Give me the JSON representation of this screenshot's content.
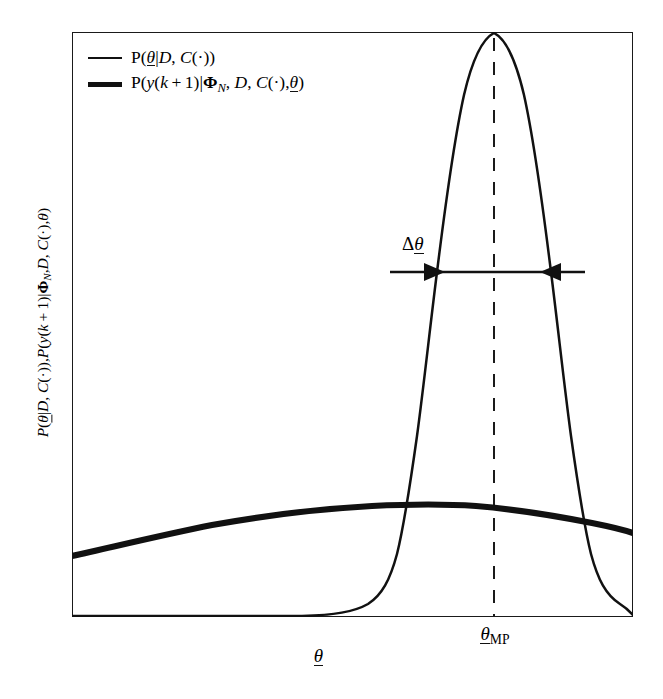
{
  "figure": {
    "background_color": "#ffffff",
    "frame_color": "#1a1a1a",
    "curve_color": "#111111"
  },
  "legend": {
    "position": "top-left",
    "entries": [
      {
        "swatch": "thin-line",
        "label_html": "P(<span class=\"mi uline\">θ</span>|<span class=\"mcal\">D</span>, <span class=\"mi\">C</span>(·))",
        "label_text": "P(θ|D, C(·))",
        "series": "parameter-posterior"
      },
      {
        "swatch": "thick-line",
        "label_html": "P(<span class=\"mi\">y</span>(<span class=\"mi\">k</span>&#8239;+&#8239;1)|<span class=\"mbf\">Φ</span><span class=\"sub it\">N</span>, <span class=\"mcal\">D</span>, <span class=\"mi\">C</span>(·),<span class=\"mi uline\">θ</span>)",
        "label_text": "P(y(k+1)|Φ_N, D, C(·),θ)",
        "series": "predictive-distribution"
      }
    ]
  },
  "axes": {
    "ylabel_html": "<span class=\"mi\">P</span>(<span class=\"mi uline\">θ</span>|<span class=\"mcal\">D</span>, <span class=\"mi\">C</span>(·)),<span class=\"mi\">P</span>(<span class=\"mi\">y</span>(<span class=\"mi\">k</span>&#8239;+&#8239;1)|<span class=\"mbf\">Φ</span><span class=\"sub it\">N</span>,<span class=\"mcal\">D</span>, <span class=\"mi\">C</span>(·),<span class=\"mi\">θ</span>)",
    "ylabel_text": "P(θ|D, C(·)),P(y(k+1)|Φ_N,D, C(·),θ)",
    "xlabel_html": "<span class=\"mi uline\">θ</span>",
    "xlabel_text": "θ",
    "xticks": [
      {
        "label_html": "<span class=\"mi uline\">θ</span><span class=\"sub\">MP</span>",
        "label_text": "θ_MP",
        "position_fraction": 0.752
      }
    ],
    "yticks": [],
    "grid": false,
    "xlim": [
      0,
      1
    ],
    "ylim": [
      0,
      1
    ]
  },
  "annotations": {
    "delta_width": {
      "label_html": "Δ<span class=\"mi uline\">θ</span>",
      "label_text": "Δθ",
      "style": "double-headed-arrow-inward",
      "y_fraction": 0.411
    },
    "map_line": {
      "style": "dashed-vertical",
      "x_fraction": 0.752
    }
  },
  "chart_data": {
    "type": "line",
    "title": "",
    "xlabel": "θ",
    "ylabel": "P(θ|D, C(·)),P(y(k+1)|Φ_N,D, C(·),θ)",
    "xlim": [
      0,
      1
    ],
    "ylim": [
      0,
      1
    ],
    "grid": false,
    "legend_position": "top-left",
    "annotations": [
      {
        "type": "vline",
        "x": 0.752,
        "style": "dashed",
        "label": "θ_MP"
      },
      {
        "type": "arrow-span",
        "x0": 0.665,
        "x1": 0.834,
        "y": 0.589,
        "label": "Δθ"
      }
    ],
    "series": [
      {
        "name": "P(θ|D, C(·))",
        "style": "thin",
        "description": "Sharply peaked posterior over the parameter vector, peaking at θ_MP",
        "peak_x": 0.752,
        "peak_y": 1.0,
        "x": [
          0.0,
          0.1,
          0.2,
          0.3,
          0.4,
          0.45,
          0.5,
          0.515,
          0.53,
          0.545,
          0.56,
          0.575,
          0.59,
          0.605,
          0.62,
          0.635,
          0.65,
          0.665,
          0.68,
          0.695,
          0.71,
          0.725,
          0.74,
          0.752,
          0.765,
          0.78,
          0.795,
          0.81,
          0.825,
          0.84,
          0.855,
          0.87,
          0.885,
          0.9,
          0.915,
          0.93,
          0.95,
          0.975,
          1.0
        ],
        "y": [
          0.0,
          0.0,
          0.0,
          0.0,
          0.001,
          0.002,
          0.005,
          0.008,
          0.013,
          0.021,
          0.034,
          0.055,
          0.087,
          0.135,
          0.203,
          0.293,
          0.401,
          0.52,
          0.64,
          0.75,
          0.845,
          0.925,
          0.982,
          1.0,
          0.985,
          0.93,
          0.845,
          0.74,
          0.62,
          0.495,
          0.375,
          0.27,
          0.184,
          0.12,
          0.075,
          0.045,
          0.018,
          0.005,
          0.001
        ]
      },
      {
        "name": "P(y(k+1)|Φ_N, D, C(·),θ)",
        "style": "thick",
        "description": "Broad, nearly flat predictive distribution with a gentle maximum left of θ_MP",
        "peak_x": 0.53,
        "peak_y": 0.176,
        "x": [
          0.0,
          0.08,
          0.16,
          0.24,
          0.32,
          0.4,
          0.46,
          0.53,
          0.6,
          0.67,
          0.74,
          0.81,
          0.88,
          0.94,
          1.0
        ],
        "y": [
          0.105,
          0.122,
          0.139,
          0.155,
          0.167,
          0.174,
          0.176,
          0.176,
          0.173,
          0.167,
          0.16,
          0.15,
          0.138,
          0.128,
          0.116
        ]
      }
    ]
  }
}
